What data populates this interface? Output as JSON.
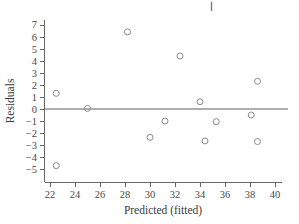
{
  "chart_data": {
    "type": "scatter",
    "title": "",
    "xlabel": "Predicted (fitted)",
    "ylabel": "Residuals",
    "xlim": [
      21.5,
      40.5
    ],
    "ylim": [
      -5.6,
      7.4
    ],
    "xticks": [
      22,
      24,
      26,
      28,
      30,
      32,
      34,
      36,
      38,
      40
    ],
    "xtick_labels": [
      "22",
      "24",
      "26",
      "28",
      "30",
      "32",
      "34",
      "36",
      "38",
      "40"
    ],
    "yticks": [
      -5,
      -4,
      -3,
      -2,
      -1,
      0,
      1,
      2,
      3,
      4,
      5,
      6,
      7
    ],
    "ytick_labels": [
      "−5",
      "−4",
      "−3",
      "−2",
      "−1",
      "0",
      "1",
      "2",
      "3",
      "4",
      "5",
      "6",
      "7"
    ],
    "grid": false,
    "legend": null,
    "reference_line": {
      "y": 0,
      "label": "zero residual line"
    },
    "marker": {
      "shape": "open-circle",
      "radius": 3,
      "color": "#8a8a8a"
    },
    "x": [
      22.5,
      22.5,
      25.0,
      28.2,
      30.0,
      31.2,
      32.4,
      34.0,
      34.4,
      35.3,
      38.1,
      38.6,
      38.6
    ],
    "y": [
      1.3,
      -4.7,
      0.05,
      6.4,
      -2.35,
      -1.0,
      4.4,
      0.6,
      -2.65,
      -1.05,
      -0.5,
      2.3,
      -2.7
    ],
    "points": [
      {
        "x": 22.5,
        "y": 1.3
      },
      {
        "x": 22.5,
        "y": -4.7
      },
      {
        "x": 25.0,
        "y": 0.05
      },
      {
        "x": 28.2,
        "y": 6.4
      },
      {
        "x": 30.0,
        "y": -2.35
      },
      {
        "x": 31.2,
        "y": -1.0
      },
      {
        "x": 32.4,
        "y": 4.4
      },
      {
        "x": 34.0,
        "y": 0.6
      },
      {
        "x": 34.4,
        "y": -2.65
      },
      {
        "x": 35.3,
        "y": -1.05
      },
      {
        "x": 38.1,
        "y": -0.5
      },
      {
        "x": 38.6,
        "y": 2.3
      },
      {
        "x": 38.6,
        "y": -2.7
      }
    ]
  },
  "axes": {
    "x_title": "Predicted (fitted)",
    "y_title": "Residuals"
  },
  "artifacts": {
    "top_mark": "|"
  }
}
